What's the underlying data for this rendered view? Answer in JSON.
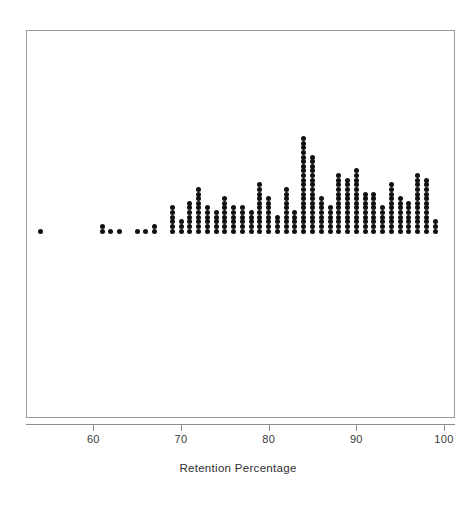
{
  "chart_data": {
    "type": "scatter",
    "subtype": "dot-plot-stacked",
    "title": "",
    "xlabel": "Retention Percentage",
    "ylabel": "",
    "xlim": [
      53,
      101
    ],
    "ylim": [
      0,
      23
    ],
    "grid": false,
    "legend": null,
    "xticks": [
      60,
      70,
      80,
      90,
      100
    ],
    "xticklabels": [
      "60",
      "70",
      "80",
      "90",
      "100"
    ],
    "dot_color": "#111111",
    "frame_color": "#9a9a9a",
    "axis_color": "#8d8d8d",
    "bin_width": 1,
    "note": "Each dot represents one observation; dots are stacked vertically at each integer retention percentage.",
    "x": [
      54,
      61,
      62,
      63,
      65,
      66,
      67,
      69,
      70,
      71,
      72,
      73,
      74,
      75,
      76,
      77,
      78,
      79,
      80,
      81,
      82,
      83,
      84,
      85,
      86,
      87,
      88,
      89,
      90,
      91,
      92,
      93,
      94,
      95,
      96,
      97,
      98,
      99
    ],
    "counts": [
      1,
      2,
      1,
      1,
      1,
      1,
      2,
      6,
      3,
      7,
      10,
      6,
      5,
      8,
      6,
      6,
      5,
      11,
      8,
      4,
      10,
      5,
      21,
      17,
      8,
      6,
      13,
      12,
      14,
      9,
      9,
      6,
      11,
      8,
      7,
      13,
      12,
      3
    ],
    "total_observations": 299
  },
  "axis": {
    "title": "Retention Percentage"
  }
}
